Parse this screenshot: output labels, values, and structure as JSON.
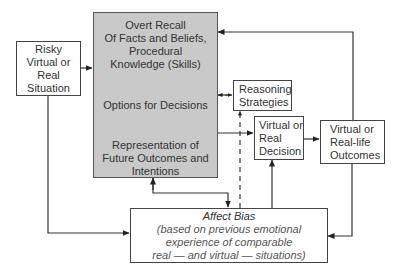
{
  "diagram": {
    "nodes": {
      "situation": {
        "lines": [
          "Risky",
          "Virtual or",
          "Real",
          "Situation"
        ]
      },
      "cognition": {
        "recall_lines": [
          "Overt Recall",
          "Of Facts and Beliefs,",
          "Procedural",
          "Knowledge (Skills)"
        ],
        "options_label": "Options for Decisions",
        "representation_lines": [
          "Representation of",
          "Future Outcomes and",
          "Intentions"
        ]
      },
      "reasoning": {
        "lines": [
          "Reasoning",
          "Strategies"
        ]
      },
      "decision": {
        "lines": [
          "Virtual or",
          "Real",
          "Decision"
        ]
      },
      "outcomes": {
        "lines": [
          "Virtual or",
          "Real-life",
          "Outcomes"
        ]
      },
      "affect": {
        "title": "Affect Bias",
        "lines": [
          "(based on previous emotional",
          "experience of comparable",
          "real — and virtual — situations)"
        ]
      }
    },
    "edges": [
      {
        "from": "situation",
        "to": "cognition",
        "style": "solid"
      },
      {
        "from": "situation",
        "to": "affect",
        "style": "solid"
      },
      {
        "from": "cognition",
        "to": "reasoning",
        "style": "dashed",
        "bidirectional": true
      },
      {
        "from": "cognition",
        "to": "decision",
        "style": "solid"
      },
      {
        "from": "cognition",
        "to": "affect",
        "style": "solid",
        "bidirectional": true
      },
      {
        "from": "affect",
        "to": "reasoning",
        "style": "dashed"
      },
      {
        "from": "affect",
        "to": "decision",
        "style": "solid"
      },
      {
        "from": "decision",
        "to": "outcomes",
        "style": "solid"
      },
      {
        "from": "outcomes",
        "to": "cognition",
        "style": "solid"
      },
      {
        "from": "outcomes",
        "to": "affect",
        "style": "solid"
      }
    ],
    "colors": {
      "gray_box": "#c9c9c9",
      "line": "#333333"
    }
  }
}
